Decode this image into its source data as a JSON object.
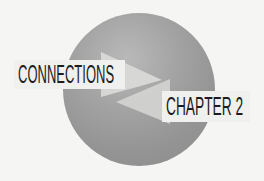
{
  "graphic": {
    "primary_label": "CONNECTIONS",
    "secondary_label": "CHAPTER 2",
    "icons": {
      "sphere": "gray-sphere-icon",
      "arrow_right": "arrow-right-icon",
      "arrow_left": "arrow-left-icon"
    },
    "colors": {
      "background": "#f5f5f4",
      "sphere": "#9a9a9a",
      "arrow": "#d9d9d8",
      "text": "#1c1c1c",
      "label_box": "#f0f0ef"
    }
  }
}
